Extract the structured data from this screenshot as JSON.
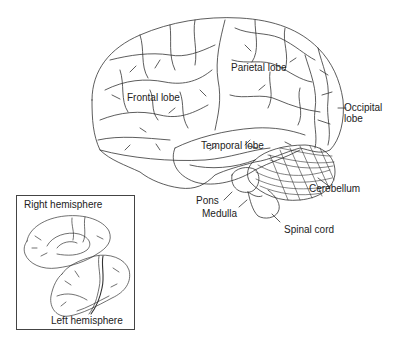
{
  "diagram": {
    "type": "anatomical-illustration",
    "colors": {
      "line": "#333333",
      "text": "#222222",
      "background": "#ffffff"
    },
    "labels": {
      "frontal": "Frontal lobe",
      "parietal": "Parietal lobe",
      "occipital_line1": "Occipital",
      "occipital_line2": "lobe",
      "temporal": "Temporal lobe",
      "cerebellum": "Cerebellum",
      "pons": "Pons",
      "medulla": "Medulla",
      "spinal_cord": "Spinal cord"
    },
    "inset": {
      "right_hemisphere": "Right hemisphere",
      "left_hemisphere": "Left hemisphere"
    }
  }
}
